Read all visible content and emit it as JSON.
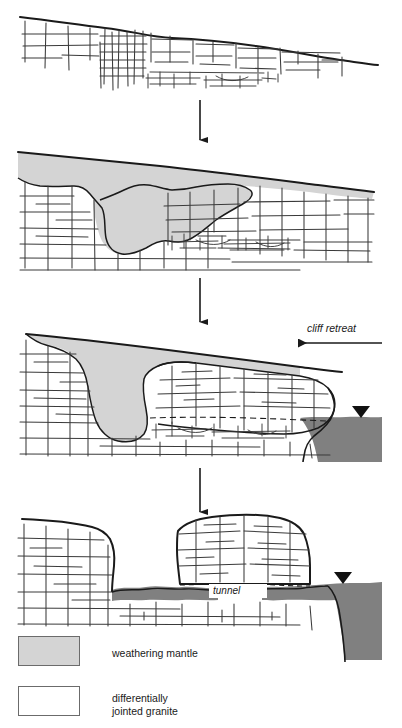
{
  "figure": {
    "title_visible": false,
    "background": "#ffffff",
    "width": 402,
    "height": 728,
    "colors": {
      "ink": "#1a1a1a",
      "joint_line": "#3a3a3a",
      "weathering_mantle": "#d4d4d4",
      "sea": "#808080",
      "legend_border": "#6b6b6b"
    }
  },
  "annotations": {
    "cliff_retreat": "cliff retreat",
    "tunnel": "tunnel"
  },
  "stages": [
    {
      "index": 1,
      "name": "stage-1-jointed-granite-bedrock",
      "description": "Uniform jointed granite with a dense joint cluster; gently sloping ground surface"
    },
    {
      "index": 2,
      "name": "stage-2-deep-weathering",
      "description": "Weathering mantle develops preferentially along densely jointed zones"
    },
    {
      "index": 3,
      "name": "stage-3-cliff-retreat-and-sea",
      "description": "Sea erodes the seaward margin; cliff retreats landward, corestone emerges"
    },
    {
      "index": 4,
      "name": "stage-4-tunnel-and-isolated-tor",
      "description": "Mantle stripped; shore platform cut, leaving an isolated tor above a tunnel"
    }
  ],
  "flow_arrows": [
    {
      "name": "stage-arrow-1-to-2",
      "direction": "down"
    },
    {
      "name": "stage-arrow-2-to-3",
      "direction": "down"
    },
    {
      "name": "stage-arrow-3-to-4",
      "direction": "down"
    },
    {
      "name": "cliff-retreat-arrow",
      "direction": "left"
    }
  ],
  "water_level_markers": [
    {
      "name": "water-level-marker-stage-3"
    },
    {
      "name": "water-level-marker-stage-4"
    }
  ],
  "legend": {
    "items": [
      {
        "swatch": "solid-gray-fill",
        "label": "weathering mantle"
      },
      {
        "swatch": "jointed-granite-pattern",
        "label": "differentially\njointed granite"
      }
    ]
  }
}
